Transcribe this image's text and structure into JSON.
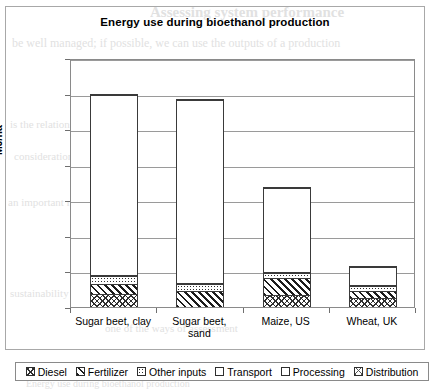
{
  "bleed_text": {
    "b1": "Assessing system performance",
    "b2": "be well managed; if possible, we can use the outputs of a production",
    "b3": "is the relation of the",
    "b4": "consideration of the",
    "b5": "an important role in the",
    "b6": "sustainability and",
    "b7": "one of the ways of assessment",
    "b8": "Energy use during bioethanol production"
  },
  "chart_data": {
    "type": "bar",
    "subtype": "stacked-column",
    "title": "Energy use during bioethanol production",
    "xlabel": "",
    "ylabel": "MJ/ha",
    "ylim": [
      0,
      140000
    ],
    "ytick_step": 20000,
    "ytick_labels": [
      "0",
      "20.000",
      "40.000",
      "60.000",
      "80.000",
      "100.000",
      "120.000",
      "140.000"
    ],
    "ytick_values": [
      0,
      20000,
      40000,
      60000,
      80000,
      100000,
      120000,
      140000
    ],
    "grid": true,
    "legend_position": "bottom",
    "categories": [
      "Sugar beet, clay",
      "Sugar beet, sand",
      "Maize, US",
      "Wheat, UK"
    ],
    "category_lines": [
      [
        "Sugar beet, clay"
      ],
      [
        "Sugar beet,",
        "sand"
      ],
      [
        "Maize, US"
      ],
      [
        "Wheat, UK"
      ]
    ],
    "series": [
      {
        "name": "Diesel",
        "pattern": "cross-hatch",
        "values": [
          7000,
          0,
          6500,
          4500
        ]
      },
      {
        "name": "Fertilizer",
        "pattern": "diagonal-hatch",
        "values": [
          5500,
          8500,
          9500,
          4000
        ]
      },
      {
        "name": "Other inputs",
        "pattern": "dotted",
        "values": [
          4500,
          4000,
          3000,
          3000
        ]
      },
      {
        "name": "Transport",
        "pattern": "dense-dot",
        "values": [
          500,
          500,
          500,
          500
        ]
      },
      {
        "name": "Processing",
        "pattern": "white",
        "values": [
          101500,
          103500,
          47500,
          10500
        ]
      },
      {
        "name": "Distribution",
        "pattern": "light-cross-hatch",
        "values": [
          500,
          500,
          500,
          500
        ]
      }
    ],
    "totals": [
      119500,
      117000,
      67500,
      23000
    ]
  }
}
